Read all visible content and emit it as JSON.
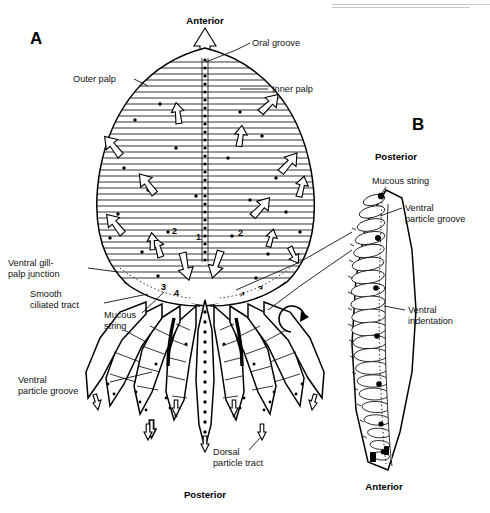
{
  "figure": {
    "background": "#ffffff",
    "ink": "#000000",
    "panels": [
      {
        "id": "A",
        "letter": "A",
        "view": "ventral face of labial palp, flattened"
      },
      {
        "id": "B",
        "letter": "B",
        "view": "lateral view of folded palp"
      }
    ]
  },
  "panel_a": {
    "letter": "A",
    "orientation_top": "Anterior",
    "orientation_bottom": "Posterior",
    "labels": {
      "oral_groove": "Oral groove",
      "outer_palp": "Outer palp",
      "inner_palp": "Inner palp",
      "ventral_gill_palp_junction": "Ventral gill-\npalp junction",
      "ventral_gill_palp_junction_l1": "Ventral gill-",
      "ventral_gill_palp_junction_l2": "palp junction",
      "smooth_ciliated_tract_l1": "Smooth",
      "smooth_ciliated_tract_l2": "ciliated tract",
      "mucous_string_l1": "Mucous",
      "mucous_string_l2": "string",
      "ventral_particle_groove_l1": "Ventral",
      "ventral_particle_groove_l2": "particle groove",
      "dorsal_particle_tract_l1": "Dorsal",
      "dorsal_particle_tract_l2": "particle tract"
    },
    "pathway_numbers": [
      "1",
      "2",
      "2",
      "3",
      "3",
      "4",
      "4"
    ]
  },
  "panel_b": {
    "letter": "B",
    "orientation_top": "Posterior",
    "orientation_bottom": "Anterior",
    "labels": {
      "mucous_string": "Mucous string",
      "ventral_particle_groove_l1": "Ventral",
      "ventral_particle_groove_l2": "particle groove",
      "ventral_indentation_l1": "Ventral",
      "ventral_indentation_l2": "indentation"
    }
  },
  "icons": {
    "rotation_arrow": "rotation-arrow-icon",
    "anterior_arrow": "up-arrow-icon",
    "flow_arrow": "flow-arrow-icon"
  }
}
